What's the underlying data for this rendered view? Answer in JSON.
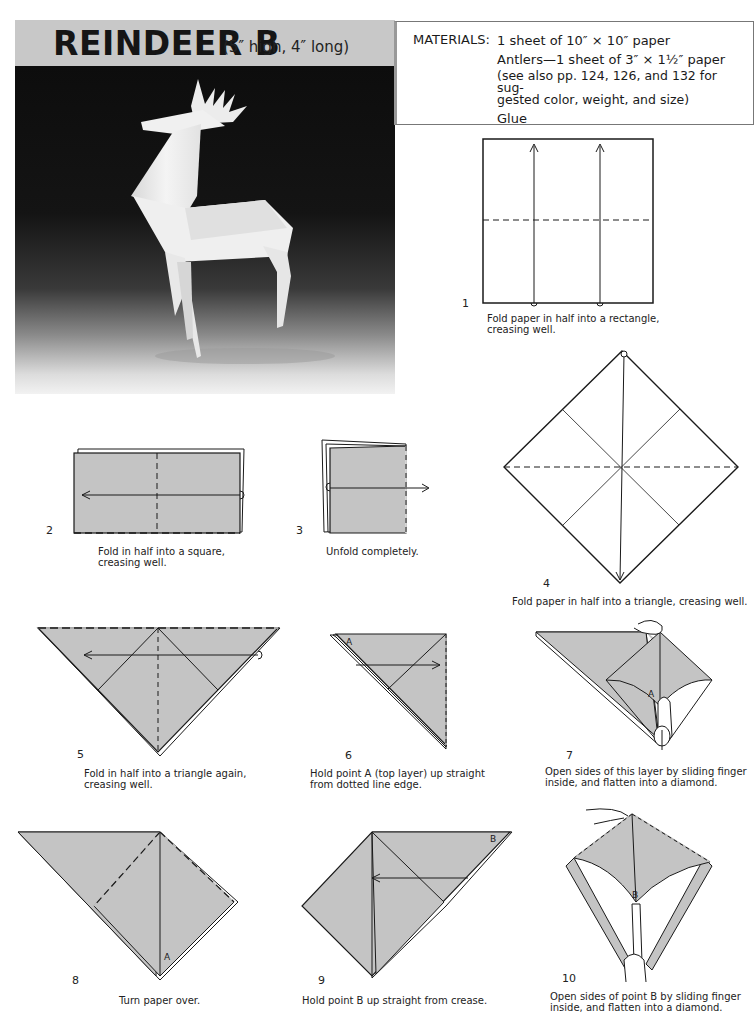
{
  "header": {
    "title": "REINDEER B",
    "dimensions": "(5″ high, 4″ long)"
  },
  "photo": {
    "subject": "white origami reindeer on dark gradient background"
  },
  "materials": {
    "label": "MATERIALS:",
    "items": [
      "1 sheet of 10″ × 10″ paper",
      "Antlers—1 sheet of 3″ × 1½″ paper",
      "(see also pp. 124, 126, and 132 for sug-",
      "gested color, weight, and size)",
      "Glue"
    ]
  },
  "steps": [
    {
      "number": "1",
      "caption": [
        "Fold paper in half into a rectangle,",
        "creasing well."
      ]
    },
    {
      "number": "2",
      "caption": [
        "Fold in half into a square,",
        "creasing well."
      ]
    },
    {
      "number": "3",
      "caption": [
        "Unfold completely."
      ]
    },
    {
      "number": "4",
      "caption": [
        "Fold paper in half into a triangle, creasing well."
      ]
    },
    {
      "number": "5",
      "caption": [
        "Fold in half into a triangle again,",
        "creasing well."
      ]
    },
    {
      "number": "6",
      "caption": [
        "Hold point A (top layer) up straight",
        "from dotted line edge."
      ],
      "point_label": "A"
    },
    {
      "number": "7",
      "caption": [
        "Open sides of this layer by sliding finger",
        "inside, and flatten into a diamond."
      ],
      "point_label": "A"
    },
    {
      "number": "8",
      "caption": [
        "Turn paper over."
      ],
      "point_label": "A"
    },
    {
      "number": "9",
      "caption": [
        "Hold point B up straight from crease."
      ],
      "point_label": "B"
    },
    {
      "number": "10",
      "caption": [
        "Open sides of point B by sliding finger",
        "inside, and flatten into a diamond."
      ],
      "point_label": "B"
    }
  ],
  "colors": {
    "paper_fill": "#c4c4c4",
    "line": "#1a1a1a",
    "title_band": "#c8c8c8"
  }
}
